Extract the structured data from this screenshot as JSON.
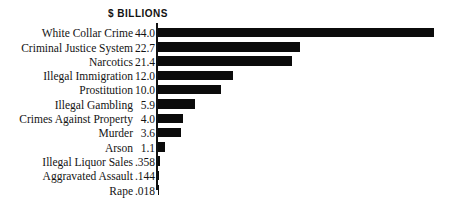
{
  "chart_data": {
    "type": "bar",
    "orientation": "horizontal",
    "title": "$ BILLIONS",
    "xlabel": "",
    "ylabel": "",
    "grid": false,
    "legend": null,
    "axis_line": "left",
    "xlim": [
      0,
      44.0
    ],
    "value_format": "leading-decimal-no-zero",
    "categories": [
      "White Collar Crime",
      "Criminal Justice System",
      "Narcotics",
      "Illegal Immigration",
      "Prostitution",
      "Illegal Gambling",
      "Crimes Against Property",
      "Murder",
      "Arson",
      "Illegal Liquor Sales",
      "Aggravated Assault",
      "Rape"
    ],
    "values": [
      44.0,
      22.7,
      21.4,
      12.0,
      10.0,
      5.9,
      4.0,
      3.6,
      1.1,
      0.358,
      0.144,
      0.018
    ],
    "value_labels": [
      "44.0",
      "22.7",
      "21.4",
      "12.0",
      "10.0",
      "5.9",
      "4.0",
      "3.6",
      "1.1",
      ".358",
      ".144",
      ".018"
    ],
    "bar_color": "#0b0b0b",
    "background_color": "#ffffff"
  }
}
